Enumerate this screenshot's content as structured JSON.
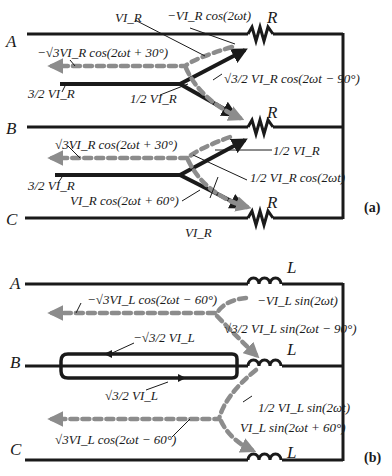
{
  "colors": {
    "wire": "#1a1a1a",
    "reactive_flow": "#8c8c8c",
    "background": "#ffffff"
  },
  "panel_a": {
    "caption": "(a)",
    "nodes": {
      "A": "A",
      "B": "B",
      "C": "C"
    },
    "components": {
      "top": "R",
      "middle": "R",
      "bottom": "R"
    },
    "labels": {
      "vi_top": "VI_R",
      "neg_vi_cos": "−VI_R cos(2ωt)",
      "neg_sqrt3_cos30": "−√3VI_R cos(2ωt + 30°)",
      "sqrt3_half_cos_m90": "√3/2 VI_R cos(2ωt − 90°)",
      "three_half_top": "3/2 VI_R",
      "half_vi_mid": "1/2 VI_R",
      "sqrt3_cos30": "√3VI_R cos(2ωt + 30°)",
      "half_vi_right": "1/2 VI_R",
      "half_vi_cos": "1/2 VI_R cos(2ωt)",
      "three_half_bottom": "3/2 VI_R",
      "vi_cos60": "VI_R cos(2ωt + 60°)",
      "vi_bottom": "VI_R"
    }
  },
  "panel_b": {
    "caption": "(b)",
    "nodes": {
      "A": "A",
      "B": "B",
      "C": "C"
    },
    "components": {
      "top": "L",
      "middle": "L",
      "bottom": "L"
    },
    "labels": {
      "neg_sqrt3_cos_m60": "−√3VI_L cos(2ωt − 60°)",
      "neg_vi_sin": "−VI_L sin(2ωt)",
      "sqrt3_half_sin_m90": "√3/2 VI_L sin(2ωt − 90°)",
      "neg_sqrt3_half": "−√3/2 VI_L",
      "sqrt3_half": "√3/2 VI_L",
      "half_sin": "1/2 VI_L sin(2ωt)",
      "vi_sin60": "VI_L sin(2ωt + 60°)",
      "sqrt3_cos_m60": "√3VI_L cos(2ωt − 60°)"
    }
  }
}
